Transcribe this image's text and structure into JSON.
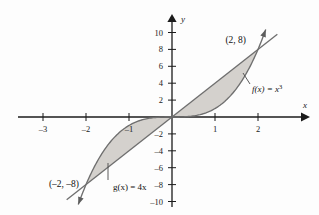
{
  "chart_data": {
    "type": "line",
    "title": "",
    "xlabel": "x",
    "ylabel": "y",
    "xlim": [
      -3.5,
      2.9
    ],
    "ylim": [
      -11.5,
      11.5
    ],
    "grid": false,
    "legend": "inline-annotations",
    "xticks": [
      -3,
      -2,
      -1,
      1,
      2
    ],
    "xtick_labels": [
      "–3",
      "–2",
      "–1",
      "1",
      "2"
    ],
    "yticks": [
      10,
      8,
      6,
      4,
      2,
      -2,
      -4,
      -6,
      -8,
      -10
    ],
    "ytick_labels": [
      "10",
      "8",
      "6",
      "4",
      "2",
      "–2",
      "–4",
      "–6",
      "–8",
      "–10"
    ],
    "series": [
      {
        "name": "f",
        "label": "f(x) = x",
        "label_exponent": "3",
        "expression": "x^3",
        "kind": "cubic",
        "domain": [
          -2.18,
          2.18
        ]
      },
      {
        "name": "g",
        "label": "g(x) = 4x",
        "label_exponent": "",
        "expression": "4x",
        "kind": "line",
        "slope": 4,
        "domain": [
          -2.45,
          2.45
        ]
      }
    ],
    "intersections": [
      {
        "label": "(2, 8)",
        "x": 2,
        "y": 8
      },
      {
        "label": "(–2, –8)",
        "x": -2,
        "y": -8
      }
    ],
    "shaded_regions": [
      {
        "name": "upper-lobe",
        "between": [
          "g",
          "f"
        ],
        "from_x": 0,
        "to_x": 2
      },
      {
        "name": "lower-lobe",
        "between": [
          "f",
          "g"
        ],
        "from_x": -2,
        "to_x": 0
      }
    ]
  },
  "colors": {
    "shade_fill": "#d4d1cd",
    "curve_stroke": "#6f6f6f",
    "axis": "#1b1b1b",
    "text": "#111111",
    "background": "#fdfdfd"
  },
  "annotations": {
    "f_label": "f(x) = x",
    "f_exponent": "3",
    "g_label": "g(x) = 4x",
    "point_upper": "(2, 8)",
    "point_lower": "(–2, –8)",
    "x_axis_label": "x",
    "y_axis_label": "y"
  }
}
